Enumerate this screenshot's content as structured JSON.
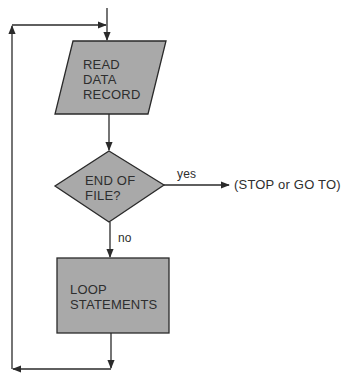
{
  "diagram": {
    "type": "flowchart",
    "colors": {
      "fill": "#a9a9a9",
      "stroke": "#2a2a2a",
      "text": "#2e2e2e",
      "background": "#ffffff"
    },
    "nodes": [
      {
        "id": "read",
        "shape": "parallelogram",
        "lines": [
          "READ",
          "DATA",
          "RECORD"
        ]
      },
      {
        "id": "eof",
        "shape": "diamond",
        "lines": [
          "END OF",
          "FILE?"
        ]
      },
      {
        "id": "loop",
        "shape": "rectangle",
        "lines": [
          "LOOP",
          "STATEMENTS"
        ]
      }
    ],
    "edges": [
      {
        "from": "entry",
        "to": "read",
        "label": ""
      },
      {
        "from": "read",
        "to": "eof",
        "label": ""
      },
      {
        "from": "eof",
        "to": "exit",
        "label": "yes"
      },
      {
        "from": "eof",
        "to": "loop",
        "label": "no"
      },
      {
        "from": "loop",
        "to": "read",
        "label": "",
        "note": "loop-back"
      }
    ],
    "exit_text": "(STOP or GO TO)",
    "yes_label": "yes",
    "no_label": "no"
  }
}
